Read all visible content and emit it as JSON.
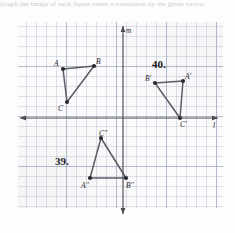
{
  "header": {
    "instruction_text": "Graph the image of each figure under a translation by the given vector."
  },
  "figure": {
    "axes": {
      "x_label": "l",
      "y_label": "m"
    },
    "problems": [
      {
        "number_label": "39."
      },
      {
        "number_label": "40."
      }
    ],
    "shapes": [
      {
        "name": "triangle-abc",
        "vertices": [
          {
            "label": "A",
            "x": 63,
            "y": 69
          },
          {
            "label": "B",
            "x": 94,
            "y": 66
          },
          {
            "label": "C",
            "x": 67,
            "y": 102
          }
        ]
      },
      {
        "name": "triangle-a-prime-b-prime-c-prime",
        "vertices": [
          {
            "label": "B'",
            "x": 155,
            "y": 83
          },
          {
            "label": "A'",
            "x": 183,
            "y": 81
          },
          {
            "label": "C'",
            "x": 180,
            "y": 118
          }
        ]
      },
      {
        "name": "triangle-a-dprime-b-dprime-c-dprime",
        "vertices": [
          {
            "label": "C''",
            "x": 101,
            "y": 138
          },
          {
            "label": "A''",
            "x": 90,
            "y": 178
          },
          {
            "label": "B''",
            "x": 126,
            "y": 178
          }
        ]
      }
    ]
  },
  "colors": {
    "grid_minor": "#96a0b9",
    "grid_major": "#8c98b4",
    "axis": "#4a4a52",
    "segment": "#5b5b63",
    "vertex": "#2a2a30",
    "text": "#25252b"
  }
}
